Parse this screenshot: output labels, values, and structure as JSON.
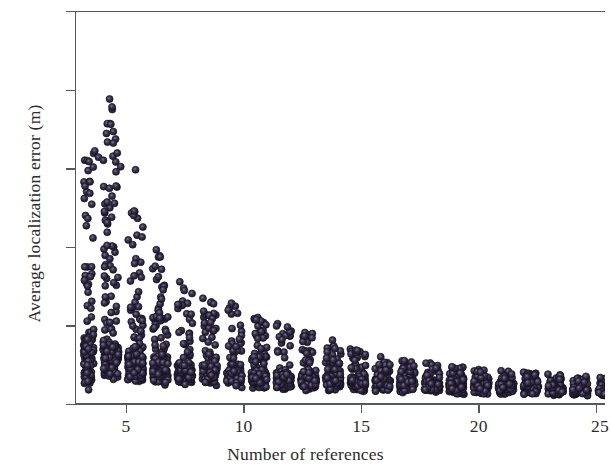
{
  "figure": {
    "background_color": "#ffffff",
    "axis_color": "#55585c",
    "text_color": "#2b2b2b"
  },
  "chart_data": {
    "type": "scatter",
    "title": "",
    "subtitle": "",
    "xlabel": "Number of references",
    "ylabel": "Average localization error (m)",
    "xlim": [
      3.55,
      25.0
    ],
    "ylim": [
      0,
      25
    ],
    "xticks": [
      5,
      10,
      15,
      20,
      25
    ],
    "xtick_labels": [
      "5",
      "10",
      "15",
      "20",
      "25"
    ],
    "yticks": [
      0,
      5,
      10,
      15,
      20,
      25
    ],
    "ytick_labels": [
      "0",
      "5",
      "10",
      "15",
      "20",
      "25"
    ],
    "grid": false,
    "legend": null,
    "legend_position": "none",
    "annotations": [],
    "marker": {
      "shape": "circle",
      "size_px": 7,
      "fill_color": "#2e2a3f",
      "edge_color": "#15121f",
      "highlight_color": "#6b6480",
      "opacity": 0.95
    },
    "series": [
      {
        "name": "Average localization error",
        "n_points": 2600,
        "description": "Dense monotonically decaying scatter cloud: error spread is widest at 4 references (approx 0.9 to 19.5 m) and narrows toward 25 references (approx 0.5 to 1.6 m).",
        "envelope": {
          "x": [
            4,
            4.5,
            5,
            5.5,
            6,
            6.5,
            7,
            7.5,
            8,
            9,
            10,
            11,
            12,
            13,
            14,
            15,
            16,
            17,
            18,
            19,
            20,
            21,
            22,
            23,
            24,
            25
          ],
          "upper": [
            16.2,
            17.8,
            19.5,
            15.4,
            13.6,
            11.2,
            9.6,
            8.6,
            7.9,
            7.0,
            6.4,
            5.6,
            5.0,
            4.6,
            4.2,
            3.4,
            3.1,
            2.9,
            2.6,
            2.4,
            2.2,
            2.1,
            2.0,
            1.9,
            1.8,
            1.7
          ],
          "lower": [
            0.9,
            1.5,
            1.4,
            1.3,
            1.3,
            1.2,
            1.2,
            1.1,
            1.1,
            1.0,
            1.0,
            0.9,
            0.9,
            0.8,
            0.8,
            0.8,
            0.7,
            0.7,
            0.7,
            0.6,
            0.6,
            0.6,
            0.6,
            0.5,
            0.5,
            0.5
          ],
          "median": [
            4.2,
            4.0,
            3.8,
            3.5,
            3.2,
            3.0,
            2.8,
            2.6,
            2.5,
            2.3,
            2.1,
            2.0,
            1.9,
            1.8,
            1.7,
            1.6,
            1.5,
            1.45,
            1.4,
            1.35,
            1.3,
            1.25,
            1.2,
            1.15,
            1.1,
            1.05
          ]
        },
        "outliers": [
          {
            "x": 4.95,
            "y": 19.4
          },
          {
            "x": 5.05,
            "y": 18.9
          },
          {
            "x": 5.0,
            "y": 17.8
          },
          {
            "x": 4.35,
            "y": 16.1
          },
          {
            "x": 4.5,
            "y": 15.7
          },
          {
            "x": 4.7,
            "y": 15.5
          },
          {
            "x": 5.2,
            "y": 15.4
          },
          {
            "x": 5.4,
            "y": 15.1
          },
          {
            "x": 4.15,
            "y": 13.4
          },
          {
            "x": 6.0,
            "y": 14.9
          },
          {
            "x": 4.1,
            "y": 0.9
          }
        ]
      }
    ]
  }
}
